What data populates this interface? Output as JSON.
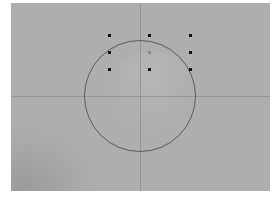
{
  "viewport": {
    "background_color": "#aeaeae",
    "frame": {
      "left": 11,
      "top": 3,
      "width": 259,
      "height": 188
    }
  },
  "crosshair": {
    "x": 129,
    "y": 93,
    "color": "#8c8c8c"
  },
  "reticle_circle": {
    "cx": 129,
    "cy": 93,
    "radius": 56,
    "color": "#5a5a5a"
  },
  "markers": [
    {
      "x": 98,
      "y": 32,
      "color": "#111111"
    },
    {
      "x": 138,
      "y": 32,
      "color": "#111111"
    },
    {
      "x": 179,
      "y": 32,
      "color": "#111111"
    },
    {
      "x": 98,
      "y": 49,
      "color": "#111111"
    },
    {
      "x": 138,
      "y": 49,
      "color": "#8a8a8a"
    },
    {
      "x": 179,
      "y": 49,
      "color": "#111111"
    },
    {
      "x": 98,
      "y": 66,
      "color": "#111111"
    },
    {
      "x": 138,
      "y": 66,
      "color": "#111111"
    },
    {
      "x": 179,
      "y": 66,
      "color": "#111111"
    }
  ]
}
